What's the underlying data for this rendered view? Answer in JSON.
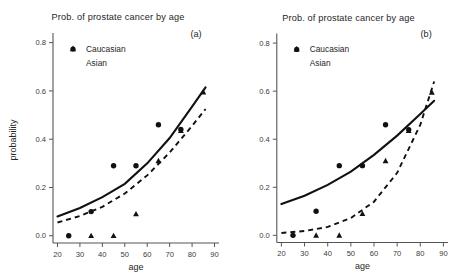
{
  "figure": {
    "axis_titles": {
      "x": "age",
      "y": "probability"
    },
    "panels": [
      {
        "tag": "(a)",
        "title": "Prob. of prostate cancer by age",
        "show_y_axis_title": true
      },
      {
        "tag": "(b)",
        "title": "Prob. of prostate cancer by age",
        "show_y_axis_title": false
      }
    ]
  },
  "legend": {
    "items": [
      {
        "label": "Caucasian",
        "marker": "circle"
      },
      {
        "label": "Asian",
        "marker": "triangle"
      }
    ]
  },
  "chart_data": [
    {
      "type": "scatter",
      "panel": "(a)",
      "title": "Prob. of prostate cancer by age",
      "xlabel": "age",
      "ylabel": "probability",
      "xlim": [
        18,
        92
      ],
      "ylim": [
        -0.03,
        0.84
      ],
      "xticks": [
        20,
        30,
        40,
        50,
        60,
        70,
        80,
        90
      ],
      "yticks": [
        0.0,
        0.2,
        0.4,
        0.6,
        0.8
      ],
      "ytick_labels": [
        "0.0",
        "0.2",
        "0.4",
        "0.6",
        "0.8"
      ],
      "xtick_labels": [
        "20",
        "30",
        "40",
        "50",
        "60",
        "70",
        "80",
        "90"
      ],
      "grid": false,
      "legend_position": "upper-left",
      "series": [
        {
          "name": "Caucasian",
          "marker": "circle",
          "points": [
            {
              "x": 25,
              "y": 0.0
            },
            {
              "x": 35,
              "y": 0.1
            },
            {
              "x": 45,
              "y": 0.29
            },
            {
              "x": 55,
              "y": 0.29
            },
            {
              "x": 65,
              "y": 0.46
            },
            {
              "x": 75,
              "y": 0.44
            }
          ],
          "fit": {
            "style": "solid",
            "x": [
              20,
              30,
              40,
              50,
              60,
              70,
              80,
              86
            ],
            "y": [
              0.08,
              0.115,
              0.16,
              0.215,
              0.3,
              0.405,
              0.535,
              0.615
            ]
          }
        },
        {
          "name": "Asian",
          "marker": "triangle",
          "points": [
            {
              "x": 35,
              "y": 0.0
            },
            {
              "x": 45,
              "y": 0.0
            },
            {
              "x": 55,
              "y": 0.09
            },
            {
              "x": 65,
              "y": 0.31
            },
            {
              "x": 75,
              "y": 0.435
            },
            {
              "x": 85,
              "y": 0.595
            }
          ],
          "fit": {
            "style": "dashed",
            "x": [
              20,
              30,
              40,
              50,
              60,
              70,
              80,
              86
            ],
            "y": [
              0.055,
              0.082,
              0.12,
              0.175,
              0.25,
              0.345,
              0.455,
              0.525
            ]
          }
        }
      ]
    },
    {
      "type": "scatter",
      "panel": "(b)",
      "title": "Prob. of prostate cancer by age",
      "xlabel": "age",
      "ylabel": "",
      "xlim": [
        18,
        92
      ],
      "ylim": [
        -0.03,
        0.84
      ],
      "xticks": [
        20,
        30,
        40,
        50,
        60,
        70,
        80,
        90
      ],
      "yticks": [
        0.0,
        0.2,
        0.4,
        0.6,
        0.8
      ],
      "ytick_labels": [
        "0.0",
        "0.2",
        "0.4",
        "0.6",
        "0.8"
      ],
      "xtick_labels": [
        "20",
        "30",
        "40",
        "50",
        "60",
        "70",
        "80",
        "90"
      ],
      "grid": false,
      "legend_position": "upper-left",
      "series": [
        {
          "name": "Caucasian",
          "marker": "circle",
          "points": [
            {
              "x": 25,
              "y": 0.0
            },
            {
              "x": 35,
              "y": 0.1
            },
            {
              "x": 45,
              "y": 0.29
            },
            {
              "x": 55,
              "y": 0.29
            },
            {
              "x": 65,
              "y": 0.46
            },
            {
              "x": 75,
              "y": 0.44
            }
          ],
          "fit": {
            "style": "solid",
            "x": [
              20,
              30,
              40,
              50,
              60,
              70,
              80,
              86
            ],
            "y": [
              0.13,
              0.165,
              0.21,
              0.265,
              0.335,
              0.415,
              0.505,
              0.56
            ]
          }
        },
        {
          "name": "Asian",
          "marker": "triangle",
          "points": [
            {
              "x": 35,
              "y": 0.0
            },
            {
              "x": 45,
              "y": 0.0
            },
            {
              "x": 55,
              "y": 0.09
            },
            {
              "x": 65,
              "y": 0.31
            },
            {
              "x": 75,
              "y": 0.435
            },
            {
              "x": 85,
              "y": 0.595
            }
          ],
          "fit": {
            "style": "dashed",
            "x": [
              20,
              30,
              40,
              50,
              60,
              70,
              80,
              86
            ],
            "y": [
              0.01,
              0.018,
              0.035,
              0.072,
              0.14,
              0.26,
              0.46,
              0.64
            ]
          }
        }
      ]
    }
  ]
}
